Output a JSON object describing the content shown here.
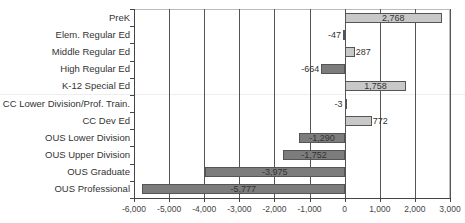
{
  "chart_data": {
    "type": "bar",
    "orientation": "horizontal",
    "title": "",
    "xlabel": "",
    "ylabel": "",
    "xlim": [
      -6000,
      3000
    ],
    "x_ticks": [
      "-6,000",
      "-5,000",
      "-4,000",
      "-3,000",
      "-2,000",
      "-1,000",
      "0",
      "1,000",
      "2,000",
      "3,000"
    ],
    "x_tick_values": [
      -6000,
      -5000,
      -4000,
      -3000,
      -2000,
      -1000,
      0,
      1000,
      2000,
      3000
    ],
    "grid": "vertical",
    "legend": "none",
    "categories": [
      "PreK",
      "Elem. Regular Ed",
      "Middle Regular Ed",
      "High Regular Ed",
      "K-12 Special Ed",
      "CC Lower Division/Prof. Train.",
      "CC Dev Ed",
      "OUS Lower Division",
      "OUS Upper Division",
      "OUS Graduate",
      "OUS Professional"
    ],
    "values": [
      2768,
      -47,
      287,
      -664,
      1758,
      -3,
      772,
      -1290,
      -1752,
      -3975,
      -5777
    ],
    "labels": [
      "2,768",
      "-47",
      "287",
      "-664",
      "1,758",
      "-3",
      "772",
      "-1,290",
      "-1,752",
      "-3,975",
      "-5,777"
    ],
    "colors": {
      "positive": "#c8c8c8",
      "negative": "#7c7c7c"
    }
  }
}
